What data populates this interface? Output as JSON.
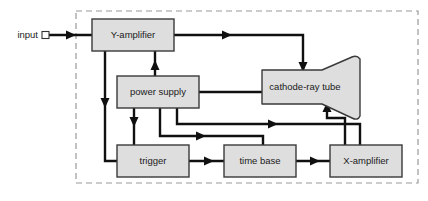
{
  "diagram": {
    "background_color": "#ffffff",
    "block_fill_color": "#dedede",
    "block_stroke_color": "#3a3a3a",
    "wire_color": "#101010",
    "enclosure_color": "#9a9a9a",
    "enclosure_style": "dashed"
  },
  "io": {
    "input_label": "input",
    "terminal_shape": "square-connector"
  },
  "blocks": [
    {
      "id": "y-amplifier",
      "label": "Y-amplifier",
      "shape": "rect",
      "x": 92,
      "y": 19,
      "w": 82,
      "h": 32
    },
    {
      "id": "power-supply",
      "label": "power supply",
      "shape": "rect",
      "x": 117,
      "y": 76,
      "w": 82,
      "h": 32
    },
    {
      "id": "cathode-ray-tube",
      "label": "cathode-ray tube",
      "shape": "crt-funnel",
      "x": 262,
      "y": 70,
      "w": 100,
      "h": 34
    },
    {
      "id": "trigger",
      "label": "trigger",
      "shape": "rect",
      "x": 117,
      "y": 145,
      "w": 72,
      "h": 32
    },
    {
      "id": "time-base",
      "label": "time base",
      "shape": "rect",
      "x": 224,
      "y": 145,
      "w": 72,
      "h": 32
    },
    {
      "id": "x-amplifier",
      "label": "X-amplifier",
      "shape": "rect",
      "x": 330,
      "y": 145,
      "w": 72,
      "h": 32
    }
  ],
  "connections": [
    {
      "from": "input",
      "to": "y-amplifier",
      "description": "input terminal to Y-amplifier"
    },
    {
      "from": "y-amplifier",
      "to": "cathode-ray-tube",
      "description": "Y-amplifier output to CRT vertical plates"
    },
    {
      "from": "power-supply",
      "to": "y-amplifier",
      "description": "power supply to Y-amplifier"
    },
    {
      "from": "y-amplifier",
      "to": "trigger",
      "description": "Y-amplifier signal to trigger"
    },
    {
      "from": "power-supply",
      "to": "trigger",
      "description": "power supply to trigger"
    },
    {
      "from": "power-supply",
      "to": "cathode-ray-tube",
      "description": "power supply to CRT"
    },
    {
      "from": "power-supply",
      "to": "x-amplifier",
      "description": "power supply to X-amplifier"
    },
    {
      "from": "trigger",
      "to": "time-base",
      "description": "trigger to time base"
    },
    {
      "from": "time-base",
      "to": "x-amplifier",
      "description": "time base to X-amplifier"
    },
    {
      "from": "x-amplifier",
      "to": "cathode-ray-tube",
      "description": "X-amplifier to CRT horizontal plates"
    }
  ]
}
